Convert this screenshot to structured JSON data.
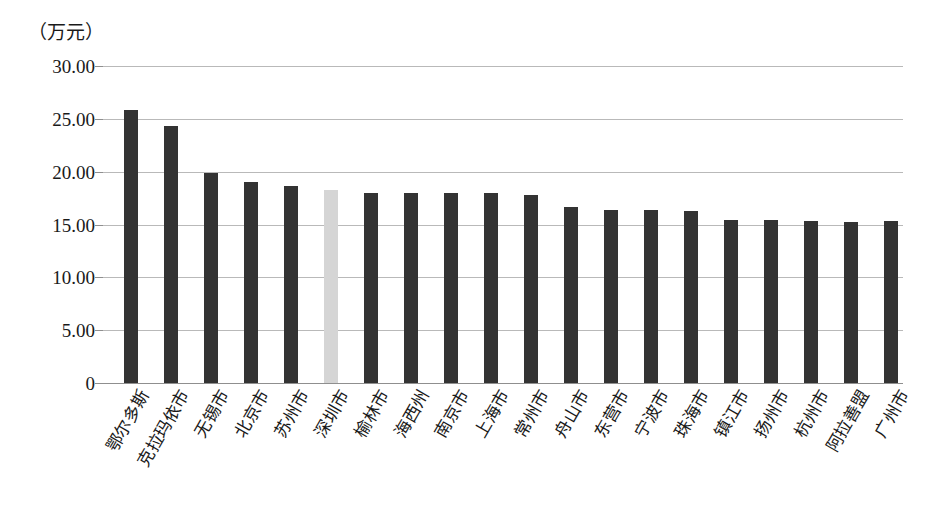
{
  "chart_data": {
    "type": "bar",
    "title": "",
    "subtitle": "",
    "unit_label": "（万元）",
    "xlabel": "",
    "ylabel": "",
    "ylim": [
      0,
      30
    ],
    "grid": true,
    "legend": false,
    "y_ticks": [
      "0",
      "5.00",
      "10.00",
      "15.00",
      "20.00",
      "25.00",
      "30.00"
    ],
    "y_tick_values": [
      0,
      5,
      10,
      15,
      20,
      25,
      30
    ],
    "categories": [
      "鄂尔多斯",
      "克拉玛依市",
      "无锡市",
      "北京市",
      "苏州市",
      "深圳市",
      "榆林市",
      "海西州",
      "南京市",
      "上海市",
      "常州市",
      "舟山市",
      "东营市",
      "宁波市",
      "珠海市",
      "镇江市",
      "扬州市",
      "杭州市",
      "阿拉善盟",
      "广州市"
    ],
    "values": [
      25.8,
      24.3,
      19.9,
      19.0,
      18.6,
      18.25,
      18.0,
      18.0,
      18.0,
      17.95,
      17.8,
      16.65,
      16.35,
      16.35,
      16.25,
      15.45,
      15.45,
      15.3,
      15.25,
      15.3
    ],
    "highlight_index": 5,
    "colors": {
      "bar": "#333333",
      "highlight_bar": "#d5d5d5",
      "gridline": "#b9b9b9",
      "axis": "#8f8f8f",
      "text": "#1a1a1a",
      "background": "#ffffff"
    }
  }
}
